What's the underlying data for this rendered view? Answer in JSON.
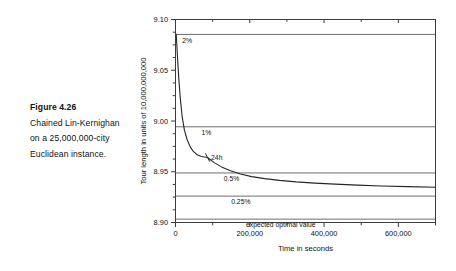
{
  "caption": {
    "title": "Figure 4.26",
    "lines": [
      "Chained Lin-Kernighan",
      "on a 25,000,000-city",
      "Euclidean instance."
    ]
  },
  "chart_data": {
    "type": "line",
    "title": "",
    "xlabel": "Time in seconds",
    "ylabel": "Tour length in units of 10,000,000,000",
    "xlim": [
      0,
      700000
    ],
    "ylim": [
      8.9,
      9.1
    ],
    "grid": true,
    "legend": "none",
    "x_ticks_major": [
      0,
      200000,
      400000,
      600000
    ],
    "x_tick_labels": [
      "0",
      "200,000",
      "400,000",
      "600,000"
    ],
    "x_ticks_minor": [
      100000,
      300000,
      500000,
      700000
    ],
    "y_ticks_major": [
      8.9,
      8.95,
      9.0,
      9.05,
      9.1
    ],
    "y_tick_labels": [
      "8.90",
      "8.95",
      "9.00",
      "9.05",
      "9.10"
    ],
    "y_ticks_minor": [
      8.9125,
      8.925,
      8.9375,
      8.9625,
      8.975,
      8.9875,
      9.0125,
      9.025,
      9.0375,
      9.0625,
      9.075,
      9.0875
    ],
    "reference_lines": [
      {
        "label": "2%",
        "value": 9.0853,
        "label_x": 18000
      },
      {
        "label": "1%",
        "value": 8.9943,
        "label_x": 70000
      },
      {
        "label": "0.5%",
        "value": 8.9488,
        "label_x": 130000
      },
      {
        "label": "0.25%",
        "value": 8.926,
        "label_x": 150000
      },
      {
        "label": "expected optimal value",
        "value": 8.9033,
        "label_x": 190000
      }
    ],
    "annotations": [
      {
        "label": "24h",
        "x": 86400,
        "y": 8.964,
        "marker": "tick"
      }
    ],
    "series": [
      {
        "name": "Chained Lin-Kernighan tour length",
        "x": [
          2000,
          4000,
          6000,
          9000,
          13000,
          18000,
          24000,
          31000,
          39000,
          48000,
          58000,
          70000,
          86400,
          104000,
          124000,
          148000,
          175000,
          205000,
          240000,
          280000,
          325000,
          375000,
          430000,
          490000,
          555000,
          625000,
          700000
        ],
        "y": [
          9.0853,
          9.072,
          9.059,
          9.041,
          9.022,
          9.004,
          8.991,
          8.982,
          8.975,
          8.97,
          8.9668,
          8.965,
          8.964,
          8.959,
          8.9548,
          8.951,
          8.9478,
          8.9452,
          8.9432,
          8.9415,
          8.94,
          8.9388,
          8.9378,
          8.9368,
          8.936,
          8.9353,
          8.9347
        ]
      }
    ]
  }
}
